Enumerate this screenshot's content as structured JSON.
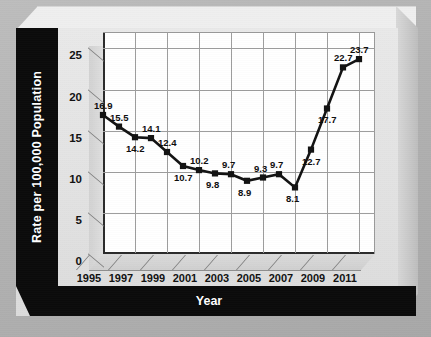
{
  "chart_data": {
    "type": "line",
    "title": "",
    "xlabel": "Year",
    "ylabel": "Rate per 100,000 Population",
    "grid": true,
    "legend": "none",
    "xlim": [
      1995,
      2012
    ],
    "ylim": [
      0,
      27
    ],
    "ytick_labels": [
      "0",
      "5",
      "10",
      "15",
      "20",
      "25"
    ],
    "yticks": [
      0,
      5,
      10,
      15,
      20,
      25
    ],
    "xtick_labels": [
      "1995",
      "1997",
      "1999",
      "2001",
      "2003",
      "2005",
      "2007",
      "2009",
      "2011"
    ],
    "xticks": [
      1995,
      1997,
      1999,
      2001,
      2003,
      2005,
      2007,
      2009,
      2011
    ],
    "x": [
      1995,
      1996,
      1997,
      1998,
      1999,
      2000,
      2001,
      2002,
      2003,
      2004,
      2005,
      2006,
      2007,
      2008,
      2009,
      2010,
      2011
    ],
    "values": [
      16.9,
      15.5,
      14.2,
      14.1,
      12.4,
      10.7,
      10.2,
      9.8,
      9.7,
      8.9,
      9.3,
      9.7,
      8.1,
      12.7,
      17.7,
      22.7,
      23.7
    ],
    "point_labels": [
      "16.9",
      "15.5",
      "14.2",
      "14.1",
      "12.4",
      "10.7",
      "10.2",
      "9.8",
      "9.7",
      "8.9",
      "9.3",
      "9.7",
      "8.1",
      "12.7",
      "17.7",
      "22.7",
      "23.7"
    ],
    "label_position": [
      "above",
      "above",
      "below",
      "above",
      "above",
      "below",
      "above",
      "below",
      "above",
      "below",
      "above",
      "above",
      "below",
      "below",
      "below",
      "above",
      "above"
    ],
    "marker": "square",
    "line_color": "#121212",
    "marker_color": "#121212",
    "plot_background": "#ffffff",
    "grid_color": "#9d9d9d",
    "panel_color": "#e4e4e4",
    "band_color": "#0b0b0b",
    "band_text_color": "#ffffff"
  }
}
